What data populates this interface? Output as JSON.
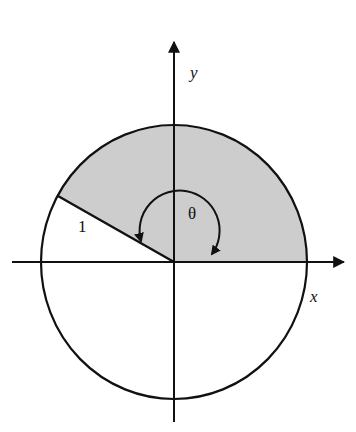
{
  "diagram": {
    "type": "unit-circle-sector",
    "labels": {
      "y_axis": "y",
      "x_axis": "x",
      "radius": "1",
      "angle": "θ"
    },
    "angle_degrees": 151,
    "colors": {
      "shaded_sector": "#cdcdcd",
      "stroke": "#111111",
      "background": "#ffffff"
    }
  }
}
